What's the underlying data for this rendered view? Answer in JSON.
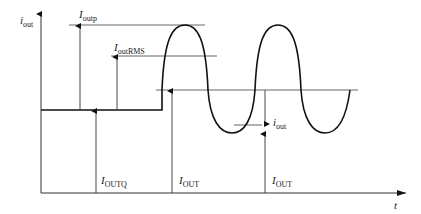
{
  "diagram": {
    "axes": {
      "y_label": {
        "main": "i",
        "sub": "out"
      },
      "x_label": "t"
    },
    "labels": {
      "peak": {
        "main": "I",
        "sub": "outp"
      },
      "rms": {
        "main": "I",
        "sub": "outRMS"
      },
      "quiescent": {
        "main": "I",
        "sub": "OUTQ"
      },
      "dc1": {
        "main": "I",
        "sub": "OUT"
      },
      "dc2": {
        "main": "I",
        "sub": "OUT"
      },
      "ac": {
        "main": "i",
        "sub": "out"
      }
    },
    "line_color": "#111111",
    "guide_color": "#555555"
  }
}
